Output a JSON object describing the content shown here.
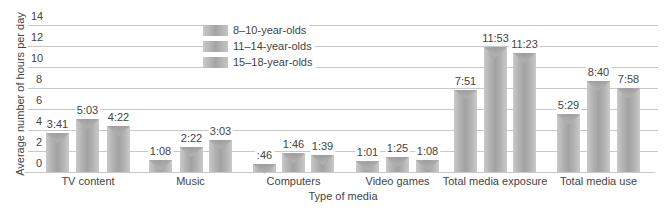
{
  "chart_data": {
    "type": "bar",
    "title": "",
    "xlabel": "Type of media",
    "ylabel": "Average number of hours per day",
    "ylim": [
      0,
      14
    ],
    "yticks": [
      0,
      2,
      4,
      6,
      8,
      10,
      12,
      14
    ],
    "grid": true,
    "legend_position": "top-left inside plot",
    "categories": [
      "TV content",
      "Music",
      "Computers",
      "Video games",
      "Total media exposure",
      "Total media use"
    ],
    "series": [
      {
        "name": "8–10-year-olds",
        "labels": [
          "3:41",
          "1:08",
          ":46",
          "1:01",
          "7:51",
          "5:29"
        ],
        "values": [
          3.68,
          1.13,
          0.77,
          1.02,
          7.85,
          5.48
        ]
      },
      {
        "name": "11–14-year-olds",
        "labels": [
          "5:03",
          "2:22",
          "1:46",
          "1:25",
          "11:53",
          "8:40"
        ],
        "values": [
          5.05,
          2.37,
          1.77,
          1.42,
          11.88,
          8.67
        ]
      },
      {
        "name": "15–18-year-olds",
        "labels": [
          "4:22",
          "3:03",
          "1:39",
          "1:08",
          "11:23",
          "7:58"
        ],
        "values": [
          4.37,
          3.05,
          1.65,
          1.13,
          11.38,
          7.97
        ]
      }
    ]
  },
  "colors": {
    "bar": "#a8a8a8",
    "grid": "#c8c8c8",
    "text": "#444444"
  }
}
